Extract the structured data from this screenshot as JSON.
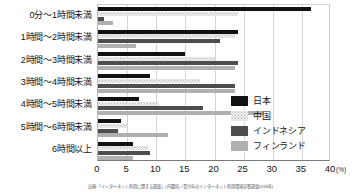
{
  "chart_data": {
    "type": "bar",
    "orientation": "horizontal",
    "title": "",
    "xlabel": "(%)",
    "ylabel": "",
    "xlim": [
      0,
      40
    ],
    "xticks": [
      "0",
      "5",
      "10",
      "15",
      "20",
      "25",
      "30",
      "35",
      "40"
    ],
    "grid": true,
    "legend_position": "right-middle",
    "categories": [
      "0分〜1時間未満",
      "1時間〜2時間未満",
      "2時間〜3時間未満",
      "3時間〜4時間未満",
      "4時間〜5時間未満",
      "5時間〜6時間未満",
      "6時間以上"
    ],
    "series": [
      {
        "name": "日本",
        "color": "#111111",
        "values": [
          36.5,
          24.0,
          15.0,
          9.0,
          7.0,
          4.0,
          6.0
        ]
      },
      {
        "name": "中国",
        "color": "#eeeeee",
        "values": [
          24.0,
          23.5,
          20.0,
          17.5,
          10.5,
          5.0,
          8.5
        ]
      },
      {
        "name": "インドネシア",
        "color": "#4d4d4d",
        "values": [
          1.0,
          21.0,
          24.0,
          23.5,
          18.0,
          3.5,
          9.0
        ]
      },
      {
        "name": "フィンランド",
        "color": "#b0b0b0",
        "values": [
          2.5,
          6.5,
          23.5,
          23.5,
          28.5,
          12.0,
          6.0
        ]
      }
    ]
  },
  "axis": {
    "x_unit": "(%)"
  },
  "legend": {
    "items": [
      {
        "label": "日本",
        "key": "jp"
      },
      {
        "label": "中国",
        "key": "cn"
      },
      {
        "label": "インドネシア",
        "key": "id"
      },
      {
        "label": "フィンランド",
        "key": "fi"
      }
    ]
  },
  "source": {
    "text": "出典:「インターネット利用に関する調査」(内閣府／青少年のインターネット利用環境実態調査2018年)"
  }
}
